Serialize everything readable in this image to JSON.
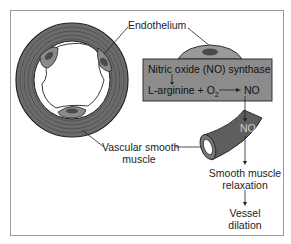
{
  "diagram": {
    "labels": {
      "endothelium": "Endothelium",
      "synthase": "Nitric oxide (NO) synthase",
      "reaction_left": "L-arginine + O",
      "reaction_sub": "2",
      "reaction_right": "NO",
      "no_on_muscle": "NO",
      "vascular_line1": "Vascular smooth",
      "vascular_line2": "muscle",
      "relax_line1": "Smooth muscle",
      "relax_line2": "relaxation",
      "dilation_line1": "Vessel",
      "dilation_line2": "dilation"
    },
    "colors": {
      "box_fill": "#8c8c8c",
      "vessel_wall": "#6b6b6b",
      "cell_fill": "#9a9a9a",
      "nucleus": "#4a4a4a",
      "stroke": "#222222"
    }
  }
}
